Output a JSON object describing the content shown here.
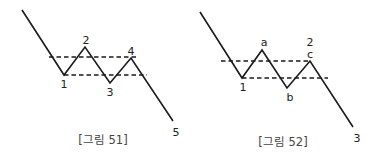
{
  "figures": [
    {
      "caption": "[그림 51]",
      "labels": {
        "p1": "1",
        "p2": "2",
        "p3": "3",
        "p4": "4",
        "p5": "5"
      }
    },
    {
      "caption": "[그림 52]",
      "labels": {
        "p1": "1",
        "pa": "a",
        "pb": "b",
        "p2": "2",
        "pc": "c",
        "p3": "3"
      }
    }
  ],
  "colors": {
    "line": "#1a1a1a",
    "text": "#222222",
    "caption": "#444444"
  }
}
